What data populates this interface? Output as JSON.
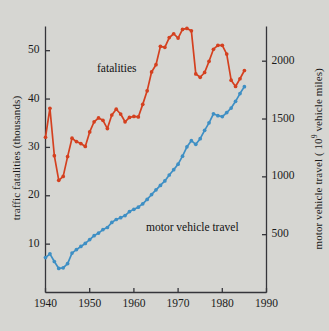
{
  "figure": {
    "background_color": "#d6d6d2",
    "fatalities_color": "#d4401f",
    "travel_color": "#3e8fc4",
    "axis_color": "#35353a"
  },
  "labels": {
    "left_axis_title": "traffic fatalities (thousands)",
    "right_axis_title_pre": "motor vehicle travel ( 10",
    "right_axis_title_sup": "9",
    "right_axis_title_post": " vehicle miles)",
    "series_fatalities": "fatalities",
    "series_travel": "motor vehicle travel"
  },
  "axes": {
    "x_ticks": [
      "1940",
      "1950",
      "1960",
      "1970",
      "1980",
      "1990"
    ],
    "y_left_ticks": [
      "10",
      "20",
      "30",
      "40",
      "50"
    ],
    "y_right_ticks": [
      "500",
      "1000",
      "1500",
      "2000"
    ]
  },
  "chart_data": {
    "type": "line",
    "title": "",
    "xlabel": "",
    "ylabel": "traffic fatalities (thousands)",
    "y2label": "motor vehicle travel (10^9 vehicle miles)",
    "xlim": [
      1940,
      1990
    ],
    "ylim": [
      0,
      55
    ],
    "y2lim": [
      0,
      2300
    ],
    "grid": false,
    "legend": "inline-annotations",
    "x": [
      1940,
      1941,
      1942,
      1943,
      1944,
      1945,
      1946,
      1947,
      1948,
      1949,
      1950,
      1951,
      1952,
      1953,
      1954,
      1955,
      1956,
      1957,
      1958,
      1959,
      1960,
      1961,
      1962,
      1963,
      1964,
      1965,
      1966,
      1967,
      1968,
      1969,
      1970,
      1971,
      1972,
      1973,
      1974,
      1975,
      1976,
      1977,
      1978,
      1979,
      1980,
      1981,
      1982,
      1983,
      1984,
      1985
    ],
    "series": [
      {
        "name": "fatalities",
        "color": "#d4401f",
        "axis": "left",
        "unit": "thousands",
        "values": [
          32.1,
          38.1,
          28.3,
          23.2,
          24.0,
          28.1,
          31.9,
          31.2,
          30.8,
          30.2,
          33.2,
          35.3,
          36.1,
          35.6,
          33.9,
          36.7,
          37.9,
          36.9,
          35.3,
          36.2,
          36.4,
          36.3,
          38.9,
          41.7,
          45.6,
          47.1,
          50.9,
          50.7,
          52.7,
          53.5,
          52.6,
          54.4,
          54.6,
          54.1,
          45.2,
          44.5,
          45.5,
          47.8,
          50.3,
          51.1,
          51.1,
          49.3,
          43.9,
          42.6,
          44.2,
          45.9
        ]
      },
      {
        "name": "motor vehicle travel",
        "color": "#3e8fc4",
        "axis": "right",
        "unit": "10^9 vehicle miles",
        "values": [
          302,
          334,
          268,
          208,
          213,
          250,
          341,
          371,
          398,
          424,
          458,
          491,
          514,
          544,
          562,
          606,
          631,
          647,
          665,
          700,
          719,
          738,
          767,
          805,
          847,
          888,
          926,
          965,
          1016,
          1062,
          1110,
          1179,
          1260,
          1313,
          1281,
          1330,
          1402,
          1467,
          1545,
          1529,
          1521,
          1556,
          1595,
          1653,
          1720,
          1780
        ]
      }
    ],
    "annotations": [
      {
        "text": "fatalities",
        "x": 1952,
        "y": 47.5
      },
      {
        "text": "motor vehicle travel",
        "x": 1968,
        "y": 14.5
      }
    ]
  }
}
